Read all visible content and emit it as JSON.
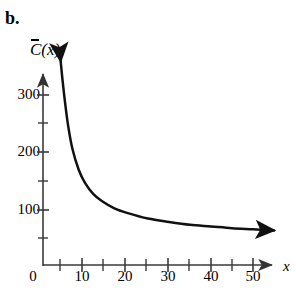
{
  "panel": {
    "label": "b."
  },
  "axes": {
    "ylabel": {
      "symbol": "C",
      "overbar": true,
      "arg": "(x)",
      "full": "C̄(x)"
    },
    "xlabel": "x",
    "origin_label": "0",
    "x_ticks_major": [
      10,
      20,
      30,
      40,
      50
    ],
    "x_ticks_minor": [
      5,
      15,
      25,
      35,
      45,
      55
    ],
    "y_ticks_major": [
      100,
      200,
      300
    ],
    "y_ticks_minor": [
      50,
      150,
      250,
      350
    ],
    "x_range": [
      0,
      57
    ],
    "y_range": [
      0,
      360
    ],
    "axis_color": "#1a1a1a"
  },
  "chart_data": {
    "type": "line",
    "title": "",
    "xlabel": "x",
    "ylabel": "C̄(x)",
    "xlim": [
      0,
      57
    ],
    "ylim": [
      0,
      360
    ],
    "grid": false,
    "legend": null,
    "xticks": [
      0,
      10,
      20,
      30,
      40,
      50
    ],
    "yticks": [
      100,
      200,
      300
    ],
    "series": [
      {
        "name": "average cost",
        "color": "#111111",
        "arrow_start": true,
        "arrow_end": true,
        "x": [
          4.2,
          4.6,
          5.2,
          6.0,
          7.0,
          8.5,
          10.0,
          12.0,
          14.0,
          17.0,
          20.0,
          25.0,
          30.0,
          35.0,
          40.0,
          45.0,
          50.0,
          55.0
        ],
        "y": [
          360,
          330,
          290,
          245,
          205,
          168,
          145,
          125,
          113,
          100,
          92,
          82,
          76,
          71,
          68,
          65,
          63,
          61
        ]
      }
    ],
    "annotations": [
      {
        "text": "b.",
        "x_px": 8,
        "y_px": 22,
        "role": "panel-label"
      }
    ]
  }
}
